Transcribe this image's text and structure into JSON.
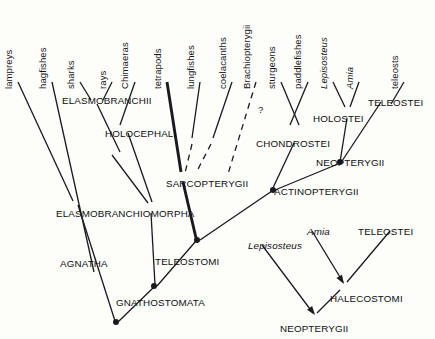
{
  "diagram": {
    "type": "cladogram",
    "background_color": "#fdfdfa",
    "line_color": "#1a1a1e",
    "text_color": "#0e0e12"
  },
  "tip_labels": [
    {
      "text": "lampreys",
      "x": 14,
      "y": 78,
      "italic": false
    },
    {
      "text": "hagfishes",
      "x": 48,
      "y": 78,
      "italic": false
    },
    {
      "text": "sharks",
      "x": 76,
      "y": 78,
      "italic": false
    },
    {
      "text": "rays",
      "x": 108,
      "y": 78,
      "italic": false
    },
    {
      "text": "Chimaeras",
      "x": 130,
      "y": 78,
      "italic": false
    },
    {
      "text": "tetrapods",
      "x": 163,
      "y": 78,
      "italic": false
    },
    {
      "text": "lungfishes",
      "x": 196,
      "y": 78,
      "italic": false
    },
    {
      "text": "coelacanths",
      "x": 228,
      "y": 78,
      "italic": false
    },
    {
      "text": "Brachiopterygii",
      "x": 252,
      "y": 78,
      "italic": false
    },
    {
      "text": "sturgeons",
      "x": 277,
      "y": 78,
      "italic": false
    },
    {
      "text": "paddlefishes",
      "x": 303,
      "y": 78,
      "italic": false
    },
    {
      "text": "Lepisosteus",
      "x": 329,
      "y": 78,
      "italic": true
    },
    {
      "text": "Amia",
      "x": 355,
      "y": 78,
      "italic": true
    },
    {
      "text": "teleosts",
      "x": 400,
      "y": 78,
      "italic": false
    }
  ],
  "clade_labels": [
    {
      "text": "ELASMOBRANCHII",
      "x": 62,
      "y": 95
    },
    {
      "text": "HOLOCEPHALI",
      "x": 105,
      "y": 128
    },
    {
      "text": "SARCOPTERYGII",
      "x": 166,
      "y": 178
    },
    {
      "text": "ELASMOBRANCHIOMORPHA",
      "x": 56,
      "y": 208
    },
    {
      "text": "AGNATHA",
      "x": 60,
      "y": 258
    },
    {
      "text": "TELEOSTOMI",
      "x": 155,
      "y": 256
    },
    {
      "text": "GNATHOSTOMATA",
      "x": 116,
      "y": 297
    },
    {
      "text": "CHONDROSTEI",
      "x": 256,
      "y": 138
    },
    {
      "text": "ACTINOPTERYGII",
      "x": 274,
      "y": 186
    },
    {
      "text": "HOLOSTEI",
      "x": 313,
      "y": 113
    },
    {
      "text": "NEOPTERYGII",
      "x": 316,
      "y": 157
    },
    {
      "text": "TELEOSTEI",
      "x": 368,
      "y": 97
    }
  ],
  "inset_labels": [
    {
      "text": "Lepisosteus",
      "x": 248,
      "y": 240,
      "italic": true
    },
    {
      "text": "Amia",
      "x": 307,
      "y": 226,
      "italic": true
    },
    {
      "text": "TELEOSTEI",
      "x": 358,
      "y": 226,
      "italic": false
    },
    {
      "text": "HALECOSTOMI",
      "x": 330,
      "y": 293,
      "italic": false
    },
    {
      "text": "NEOPTERYGII",
      "x": 280,
      "y": 323,
      "italic": false
    }
  ],
  "annotations": [
    {
      "text": "?",
      "x": 258,
      "y": 104
    }
  ],
  "branches": {
    "tips": [
      {
        "name": "lampreys-branch",
        "x1": 18,
        "y1": 82,
        "x2": 73,
        "y2": 201,
        "width": 1.3,
        "style": "solid"
      },
      {
        "name": "hagfishes-branch",
        "x1": 52,
        "y1": 82,
        "x2": 94,
        "y2": 272,
        "width": 1.3,
        "style": "solid"
      },
      {
        "name": "sharks-branch",
        "x1": 80,
        "y1": 82,
        "x2": 91,
        "y2": 100,
        "width": 1.3,
        "style": "solid"
      },
      {
        "name": "rays-branch",
        "x1": 112,
        "y1": 82,
        "x2": 103,
        "y2": 100,
        "width": 1.3,
        "style": "solid"
      },
      {
        "name": "chimaeras-branch",
        "x1": 135,
        "y1": 82,
        "x2": 120,
        "y2": 125,
        "width": 1.3,
        "style": "solid"
      },
      {
        "name": "tetrapods-branch",
        "x1": 167,
        "y1": 82,
        "x2": 181,
        "y2": 172,
        "width": 2.9,
        "style": "solid"
      },
      {
        "name": "lungfishes-branch",
        "x1": 200,
        "y1": 82,
        "x2": 192,
        "y2": 138,
        "width": 1.3,
        "style": "solid"
      },
      {
        "name": "lungfishes-dash",
        "x1": 192,
        "y1": 144,
        "x2": 185,
        "y2": 173,
        "width": 1.3,
        "style": "dashed"
      },
      {
        "name": "coelacanths-branch",
        "x1": 232,
        "y1": 82,
        "x2": 213,
        "y2": 138,
        "width": 1.3,
        "style": "solid"
      },
      {
        "name": "coelacanths-dash",
        "x1": 211,
        "y1": 144,
        "x2": 196,
        "y2": 173,
        "width": 1.3,
        "style": "dashed"
      },
      {
        "name": "brachiopterygii-dash",
        "x1": 256,
        "y1": 82,
        "x2": 228,
        "y2": 174,
        "width": 1.3,
        "style": "dashed"
      },
      {
        "name": "sturgeons-branch",
        "x1": 281,
        "y1": 82,
        "x2": 299,
        "y2": 125,
        "width": 1.3,
        "style": "solid"
      },
      {
        "name": "paddlefishes-branch",
        "x1": 308,
        "y1": 82,
        "x2": 290,
        "y2": 125,
        "width": 1.3,
        "style": "solid"
      },
      {
        "name": "lepisosteus-branch",
        "x1": 333,
        "y1": 82,
        "x2": 345,
        "y2": 107,
        "width": 1.3,
        "style": "solid"
      },
      {
        "name": "amia-branch",
        "x1": 359,
        "y1": 82,
        "x2": 350,
        "y2": 107,
        "width": 1.3,
        "style": "solid"
      },
      {
        "name": "teleosts-branch",
        "x1": 404,
        "y1": 82,
        "x2": 391,
        "y2": 104,
        "width": 1.3,
        "style": "solid"
      }
    ],
    "internal": [
      {
        "name": "elasmobranchii-to-node",
        "x1": 97,
        "y1": 104,
        "x2": 120,
        "y2": 152,
        "width": 1.3,
        "style": "solid"
      },
      {
        "name": "holocephali-to-node",
        "x1": 128,
        "y1": 133,
        "x2": 152,
        "y2": 202,
        "width": 1.3,
        "style": "solid"
      },
      {
        "name": "elasmobranchiomorpha-stem",
        "x1": 112,
        "y1": 155,
        "x2": 148,
        "y2": 203,
        "width": 1.3,
        "style": "solid"
      },
      {
        "name": "sarcopterygii-stem",
        "x1": 183,
        "y1": 182,
        "x2": 196,
        "y2": 238,
        "width": 2.9,
        "style": "solid"
      },
      {
        "name": "actinopterygii-stem",
        "x1": 272,
        "y1": 191,
        "x2": 200,
        "y2": 240,
        "width": 1.3,
        "style": "solid"
      },
      {
        "name": "teleostomi-stem",
        "x1": 196,
        "y1": 241,
        "x2": 157,
        "y2": 286,
        "width": 1.3,
        "style": "solid"
      },
      {
        "name": "elasmo-to-gnatho",
        "x1": 151,
        "y1": 213,
        "x2": 155,
        "y2": 285,
        "width": 1.3,
        "style": "solid"
      },
      {
        "name": "gnathostomata-stem",
        "x1": 154,
        "y1": 287,
        "x2": 118,
        "y2": 322,
        "width": 1.3,
        "style": "solid"
      },
      {
        "name": "agnatha-stem",
        "x1": 78,
        "y1": 205,
        "x2": 115,
        "y2": 321,
        "width": 1.3,
        "style": "solid"
      },
      {
        "name": "chondrostei-to-actino",
        "x1": 294,
        "y1": 143,
        "x2": 272,
        "y2": 190,
        "width": 1.3,
        "style": "solid"
      },
      {
        "name": "holostei-to-neopterygii",
        "x1": 347,
        "y1": 118,
        "x2": 340,
        "y2": 162,
        "width": 1.3,
        "style": "solid"
      },
      {
        "name": "teleostei-to-neopterygii",
        "x1": 381,
        "y1": 102,
        "x2": 342,
        "y2": 161,
        "width": 1.3,
        "style": "solid"
      },
      {
        "name": "neopterygii-to-actino",
        "x1": 338,
        "y1": 164,
        "x2": 275,
        "y2": 190,
        "width": 1.3,
        "style": "solid"
      }
    ],
    "inset": [
      {
        "name": "inset-lepisosteus-branch",
        "x1": 262,
        "y1": 245,
        "x2": 313,
        "y2": 313,
        "width": 1.3,
        "style": "solid"
      },
      {
        "name": "inset-amia-branch",
        "x1": 312,
        "y1": 231,
        "x2": 343,
        "y2": 282,
        "width": 1.3,
        "style": "solid"
      },
      {
        "name": "inset-teleostei-branch",
        "x1": 390,
        "y1": 231,
        "x2": 347,
        "y2": 282,
        "width": 1.3,
        "style": "solid"
      },
      {
        "name": "inset-halecostomi-stem",
        "x1": 340,
        "y1": 290,
        "x2": 317,
        "y2": 313,
        "width": 1.3,
        "style": "solid"
      }
    ],
    "nodes": [
      {
        "name": "node-gnathostomata",
        "x": 154,
        "y": 286
      },
      {
        "name": "node-teleostomi",
        "x": 197,
        "y": 240
      },
      {
        "name": "node-actinopterygii",
        "x": 273,
        "y": 190
      },
      {
        "name": "node-neopterygii",
        "x": 340,
        "y": 162
      },
      {
        "name": "node-agnatha",
        "x": 116,
        "y": 322
      }
    ],
    "arrowheads": [
      {
        "name": "arrow-halecostomi",
        "x": 344,
        "y": 284,
        "angle": 58
      },
      {
        "name": "arrow-neopterygii",
        "x": 315,
        "y": 315,
        "angle": 53
      }
    ]
  }
}
